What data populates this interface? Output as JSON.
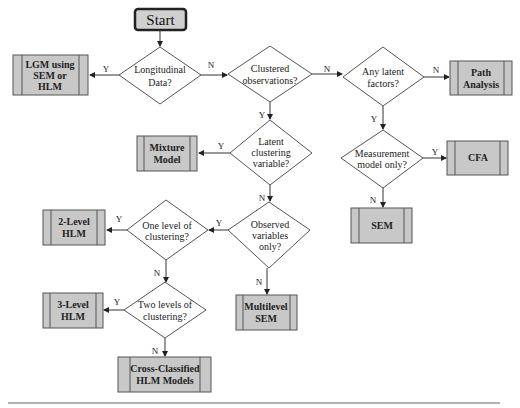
{
  "flowchart": {
    "start": "Start",
    "decisions": {
      "longitudinal": [
        "Longitudinal",
        "Data?"
      ],
      "clustered": [
        "Clustered",
        "observations?"
      ],
      "latent_factors": [
        "Any latent",
        "factors?"
      ],
      "latent_clustering": [
        "Latent",
        "clustering",
        "variable?"
      ],
      "measurement": [
        "Measurement",
        "model only?"
      ],
      "observed": [
        "Observed",
        "variables",
        "only?"
      ],
      "one_level": [
        "One level of",
        "clustering?"
      ],
      "two_levels": [
        "Two levels of",
        "clustering?"
      ]
    },
    "outcomes": {
      "lgm": [
        "LGM using",
        "SEM or",
        "HLM"
      ],
      "path": [
        "Path",
        "Analysis"
      ],
      "mixture": [
        "Mixture",
        "Model"
      ],
      "cfa": [
        "CFA"
      ],
      "sem": [
        "SEM"
      ],
      "hlm2": [
        "2-Level",
        "HLM"
      ],
      "hlm3": [
        "3-Level",
        "HLM"
      ],
      "msem": [
        "Multilevel",
        "SEM"
      ],
      "cross": [
        "Cross-Classified",
        "HLM Models"
      ]
    },
    "edge_labels": {
      "yes": "Y",
      "no": "N"
    },
    "colors": {
      "box_fill": "#c8c8c8",
      "box_border": "#555555",
      "line": "#333333"
    }
  }
}
